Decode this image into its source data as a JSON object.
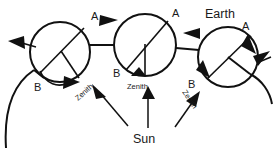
{
  "diagram": {
    "title_label": "Earth",
    "sun_label": "Sun",
    "labels": {
      "pole_a": "A",
      "pole_b": "B",
      "zenith": "Zenith"
    },
    "colors": {
      "stroke": "#111111",
      "text": "#1a1a1a",
      "background": "#ffffff"
    },
    "earths": [
      {
        "id": "earth-left",
        "cx": 60,
        "cy": 52,
        "r": 30,
        "label_a": "A",
        "label_b": "B",
        "a_x": 95,
        "a_y": 17,
        "b_x": 38,
        "b_y": 86
      },
      {
        "id": "earth-middle",
        "cx": 145,
        "cy": 45,
        "r": 31,
        "label_a": "A",
        "label_b": "B",
        "zenith_label": "Zenith",
        "a_x": 176,
        "a_y": 14,
        "b_x": 117,
        "b_y": 72,
        "zenith_x": 130,
        "zenith_y": 86
      },
      {
        "id": "earth-right",
        "cx": 228,
        "cy": 57,
        "r": 30,
        "label_a": "A",
        "label_b": "B",
        "a_x": 246,
        "a_y": 34,
        "b_x": 193,
        "b_y": 84
      }
    ],
    "zenith_arrows": [
      {
        "id": "zenith-arrow-left",
        "label": "Zenith",
        "label_x": 80,
        "label_y": 96,
        "rotation": -45
      },
      {
        "id": "zenith-arrow-right",
        "label": "Zenith",
        "label_x": 182,
        "label_y": 96,
        "rotation": 55
      }
    ],
    "sun_rays": [
      {
        "id": "sun-ray-left",
        "from_x": 127,
        "from_y": 126,
        "to_x": 94,
        "to_y": 88
      },
      {
        "id": "sun-ray-center",
        "from_x": 148,
        "from_y": 128,
        "to_x": 148,
        "to_y": 92
      },
      {
        "id": "sun-ray-right",
        "from_x": 174,
        "from_y": 126,
        "to_x": 190,
        "to_y": 92
      }
    ],
    "sun_label_x": 148,
    "sun_label_y": 142,
    "earth_title_x": 230,
    "earth_title_y": 14
  }
}
